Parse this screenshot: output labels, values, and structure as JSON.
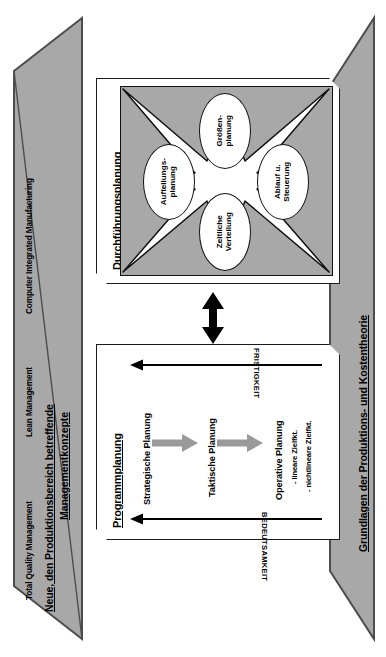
{
  "diagram": {
    "language": "de"
  },
  "left_panel": {
    "title": "Neue, den Produktionsbereich betreffende Managementkonzepte",
    "title_line1": "Neue, den Produktionsbereich betreffende",
    "title_line2": "Managementkonzepte",
    "items": [
      {
        "label": "Total Quality Management"
      },
      {
        "label": "Lean Management"
      },
      {
        "label": "Computer Integrated Manufacturing"
      }
    ],
    "fill_color": "#a8a8a8",
    "stroke_color": "#4d4d4d"
  },
  "right_panel": {
    "title": "Grundlagen der Produktions- und Kostentheorie",
    "fill_color": "#a8a8a8",
    "stroke_color": "#4d4d4d"
  },
  "durchfuehrungsplanung": {
    "title": "Durchführungsplanung",
    "graphic_fill": "#a8a8a8",
    "star_fill": "#ffffff",
    "nodes": [
      {
        "id": "groessenplanung",
        "label": "Größen-\nplanung",
        "position": "top"
      },
      {
        "id": "aufteilungsplanung",
        "label": "Aufteilungs-\nplanung",
        "position": "left"
      },
      {
        "id": "ablauf-steuerung",
        "label": "Ablauf u.\nSteuerung",
        "position": "right"
      },
      {
        "id": "zeitliche-verteilung",
        "label": "Zeitliche\nVerteilung",
        "position": "bottom"
      }
    ]
  },
  "connector": {
    "type": "double-headed-arrow",
    "orientation": "vertical",
    "color": "#000000"
  },
  "programmplanung": {
    "title": "Programmplanung",
    "axis_top_label": "FRISTIGKEIT",
    "axis_bottom_label": "BEDEUTSAMKEIT",
    "arrow_color": "#9a9a9a",
    "stages": [
      {
        "id": "strategische-planung",
        "label": "Strategische Planung",
        "sub_items": []
      },
      {
        "id": "taktische-planung",
        "label": "Taktische Planung",
        "sub_items": []
      },
      {
        "id": "operative-planung",
        "label": "Operative Planung",
        "sub_items": [
          "- lineare Zielfkt.",
          "- nichtlineare Zielfkt."
        ]
      }
    ]
  }
}
